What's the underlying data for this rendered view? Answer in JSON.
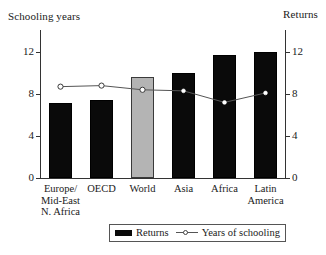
{
  "chart_data": {
    "type": "bar",
    "title": "",
    "categories": [
      "Europe/ Mid-East N. Africa",
      "OECD",
      "World",
      "Asia",
      "Africa",
      "Latin America"
    ],
    "category_lines": [
      [
        "Europe/",
        "Mid-East",
        "N. Africa"
      ],
      [
        "OECD"
      ],
      [
        "World"
      ],
      [
        "Asia"
      ],
      [
        "Africa"
      ],
      [
        "Latin",
        "America"
      ]
    ],
    "left_axis": {
      "label": "Schooling years",
      "ticks": [
        "0",
        "4",
        "8",
        "12"
      ],
      "min": 0,
      "max": 12
    },
    "right_axis": {
      "label": "Returns",
      "ticks": [
        "0",
        "4",
        "8",
        "12"
      ],
      "min": 0,
      "max": 12
    },
    "series": [
      {
        "name": "Returns",
        "kind": "bar",
        "axis": "right",
        "color": "#0a0a0a",
        "highlight_color": "#b4b4b4",
        "highlight_index": 2,
        "values": [
          7.1,
          7.4,
          9.6,
          10.0,
          11.7,
          12.0
        ]
      },
      {
        "name": "Years of schooling",
        "kind": "line",
        "axis": "left",
        "color": "#555555",
        "marker": "open-circle",
        "values": [
          8.7,
          8.8,
          8.4,
          8.3,
          7.2,
          8.1
        ]
      }
    ],
    "legend": {
      "position": "bottom",
      "entries": [
        "Returns",
        "Years of schooling"
      ]
    },
    "grid": false
  }
}
